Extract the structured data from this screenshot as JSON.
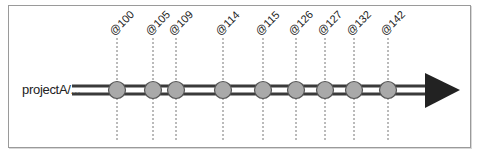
{
  "diagram": {
    "branch": {
      "label": "projectA/..."
    },
    "changelists": [
      {
        "label": "@100",
        "x": 117
      },
      {
        "label": "@105",
        "x": 153
      },
      {
        "label": "@109",
        "x": 176
      },
      {
        "label": "@114",
        "x": 223
      },
      {
        "label": "@115",
        "x": 263
      },
      {
        "label": "@126",
        "x": 296
      },
      {
        "label": "@127",
        "x": 325
      },
      {
        "label": "@132",
        "x": 354
      },
      {
        "label": "@142",
        "x": 388
      }
    ],
    "colors": {
      "track": "#3a3a3a",
      "node_fill": "#a9a9a9",
      "node_stroke": "#555555",
      "arrow": "#222222",
      "guide": "#777777",
      "frame": "#9a9a9a"
    }
  }
}
